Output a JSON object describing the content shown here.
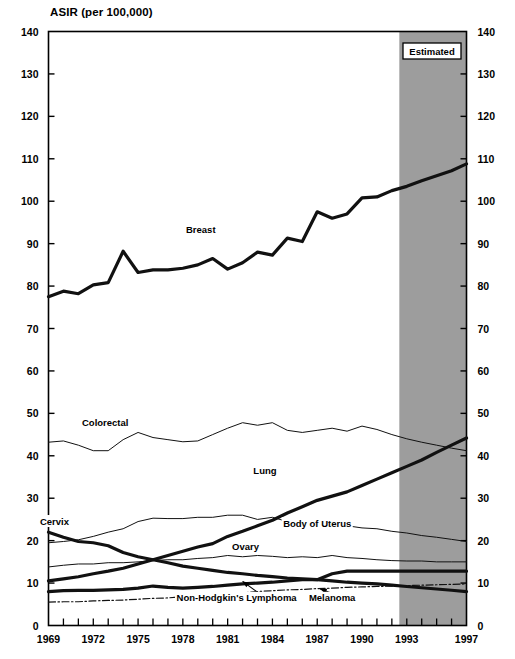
{
  "chart_data": {
    "type": "line",
    "title": "",
    "ylabel": "ASIR (per 100,000)",
    "xlabel": "",
    "ylim": [
      0,
      140
    ],
    "xlim": [
      1969,
      1997
    ],
    "yticks": [
      0,
      10,
      20,
      30,
      40,
      50,
      60,
      70,
      80,
      90,
      100,
      110,
      120,
      130,
      140
    ],
    "xticks": [
      1969,
      1970,
      1971,
      1972,
      1973,
      1974,
      1975,
      1976,
      1977,
      1978,
      1979,
      1980,
      1981,
      1982,
      1983,
      1984,
      1985,
      1986,
      1987,
      1988,
      1989,
      1990,
      1991,
      1992,
      1993,
      1994,
      1995,
      1996,
      1997
    ],
    "xtick_labels": [
      "1969",
      "",
      "",
      "1972",
      "",
      "",
      "1975",
      "",
      "",
      "1978",
      "",
      "",
      "1981",
      "",
      "",
      "1984",
      "",
      "",
      "1987",
      "",
      "",
      "1990",
      "",
      "",
      "1993",
      "",
      "",
      "",
      "1997"
    ],
    "grid": false,
    "legend_position": "inline-labels",
    "dual_y_axis": true,
    "annotations": [
      {
        "name": "estimated-region",
        "label": "Estimated",
        "x_start": 1992.5,
        "x_end": 1997,
        "fill": "#9d9d9d"
      }
    ],
    "x": [
      1969,
      1970,
      1971,
      1972,
      1973,
      1974,
      1975,
      1976,
      1977,
      1978,
      1979,
      1980,
      1981,
      1982,
      1983,
      1984,
      1985,
      1986,
      1987,
      1988,
      1989,
      1990,
      1991,
      1992,
      1993,
      1994,
      1995,
      1996,
      1997
    ],
    "series": [
      {
        "name": "Breast",
        "label": "Breast",
        "style": "thick-solid",
        "label_x": 1979.2,
        "label_y": 92.5,
        "values": [
          77.5,
          78.8,
          78.2,
          80.3,
          80.8,
          88.2,
          83.2,
          83.8,
          83.8,
          84.2,
          85.0,
          86.5,
          84.0,
          85.5,
          88.0,
          87.3,
          91.3,
          90.5,
          97.5,
          96.0,
          97.0,
          100.8,
          101.0,
          102.5,
          103.5,
          104.8,
          106.0,
          107.2,
          108.8
        ]
      },
      {
        "name": "Colorectal",
        "label": "Colorectal",
        "style": "thin-solid",
        "label_x": 1972.8,
        "label_y": 47.0,
        "values": [
          43.2,
          43.5,
          42.5,
          41.2,
          41.2,
          43.8,
          45.5,
          44.3,
          43.8,
          43.3,
          43.5,
          45.0,
          46.5,
          47.8,
          47.2,
          47.8,
          46.0,
          45.5,
          46.0,
          46.5,
          45.8,
          47.0,
          46.2,
          45.0,
          44.0,
          43.2,
          42.5,
          41.8,
          41.2
        ]
      },
      {
        "name": "Lung",
        "label": "Lung",
        "style": "thick-solid",
        "label_x": 1983.5,
        "label_y": 35.8,
        "values": [
          10.5,
          11.0,
          11.5,
          12.2,
          12.8,
          13.5,
          14.5,
          15.5,
          16.5,
          17.5,
          18.5,
          19.3,
          21.0,
          22.2,
          23.5,
          24.8,
          26.5,
          28.0,
          29.5,
          30.5,
          31.5,
          33.0,
          34.5,
          36.0,
          37.5,
          39.0,
          40.8,
          42.5,
          44.2
        ]
      },
      {
        "name": "Cervix",
        "label": "Cervix",
        "style": "thick-solid",
        "label_x": 1969.4,
        "label_y": 23.8,
        "values": [
          22.0,
          20.8,
          19.8,
          19.5,
          18.8,
          17.2,
          16.2,
          15.5,
          14.8,
          14.0,
          13.5,
          13.0,
          12.5,
          12.2,
          11.8,
          11.5,
          11.2,
          11.0,
          10.8,
          10.5,
          10.2,
          10.0,
          9.8,
          9.5,
          9.2,
          8.9,
          8.6,
          8.3,
          8.0
        ]
      },
      {
        "name": "Body of Uterus",
        "label": "Body of Uterus",
        "style": "thin-solid",
        "label_x": 1987.0,
        "label_y": 23.3,
        "values": [
          19.5,
          19.8,
          20.2,
          21.0,
          22.0,
          22.8,
          24.5,
          25.3,
          25.2,
          25.2,
          25.5,
          25.5,
          26.0,
          26.0,
          25.0,
          25.5,
          24.5,
          24.0,
          24.0,
          23.3,
          23.5,
          23.0,
          22.8,
          22.2,
          21.8,
          21.2,
          20.8,
          20.3,
          19.8
        ]
      },
      {
        "name": "Ovary",
        "label": "Ovary",
        "style": "thin-solid",
        "label_x": 1982.2,
        "label_y": 17.8,
        "values": [
          13.8,
          14.2,
          14.5,
          14.5,
          14.8,
          14.8,
          15.0,
          15.3,
          15.5,
          15.5,
          15.8,
          16.0,
          16.5,
          16.2,
          16.5,
          16.3,
          16.0,
          16.2,
          16.0,
          16.5,
          16.0,
          15.8,
          15.5,
          15.3,
          15.2,
          15.2,
          15.0,
          15.0,
          15.0
        ]
      },
      {
        "name": "Non-Hodgkin's Lymphoma",
        "label": "Non-Hodgkin's Lymphoma",
        "style": "thick-solid",
        "label_x": 1981.6,
        "label_y": 5.7,
        "arrow": {
          "from_x": 1983.6,
          "from_y": 6.3,
          "to_x": 1982.0,
          "to_y": 10.4
        },
        "values": [
          8.0,
          8.2,
          8.3,
          8.3,
          8.4,
          8.5,
          8.8,
          9.3,
          9.0,
          8.8,
          9.0,
          9.2,
          9.5,
          9.8,
          10.0,
          10.2,
          10.5,
          10.8,
          10.8,
          12.2,
          12.8,
          12.8,
          12.8,
          12.8,
          12.8,
          12.8,
          12.8,
          12.8,
          12.8
        ]
      },
      {
        "name": "Melanoma",
        "label": "Melanoma",
        "style": "dash-dot",
        "label_x": 1988.0,
        "label_y": 5.7,
        "arrow": {
          "from_x": 1989.0,
          "from_y": 6.3,
          "to_x": 1987.2,
          "to_y": 8.6
        },
        "values": [
          5.5,
          5.6,
          5.6,
          5.8,
          5.9,
          6.0,
          6.2,
          6.4,
          6.5,
          6.8,
          7.0,
          7.3,
          7.6,
          7.7,
          8.0,
          8.2,
          8.4,
          8.5,
          8.7,
          8.8,
          9.0,
          9.1,
          9.2,
          9.3,
          9.4,
          9.5,
          9.6,
          9.7,
          9.8
        ]
      }
    ]
  }
}
